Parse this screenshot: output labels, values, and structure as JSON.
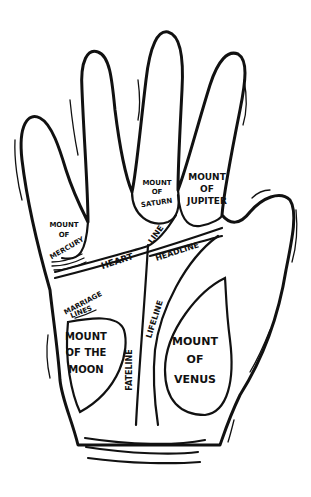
{
  "diagram": {
    "colors": {
      "ink": "#111111",
      "background": "#ffffff"
    },
    "labels": {
      "mount_saturn": [
        "MOUNT",
        "OF",
        "SATURN"
      ],
      "mount_jupiter": [
        "MOUNT",
        "OF",
        "JUPITER"
      ],
      "mount_mercury": [
        "MOUNT",
        "OF",
        "MERCURY"
      ],
      "mount_moon": [
        "MOUNT",
        "OF THE",
        "MOON"
      ],
      "mount_venus": [
        "MOUNT",
        "OF",
        "VENUS"
      ],
      "heart_line": [
        "HEART",
        "LINE"
      ],
      "headline": "HEADLINE",
      "marriage_lines": [
        "MARRIAGE",
        "LINES"
      ],
      "lifeline": "LIFELINE",
      "fateline": "FATELINE"
    }
  }
}
